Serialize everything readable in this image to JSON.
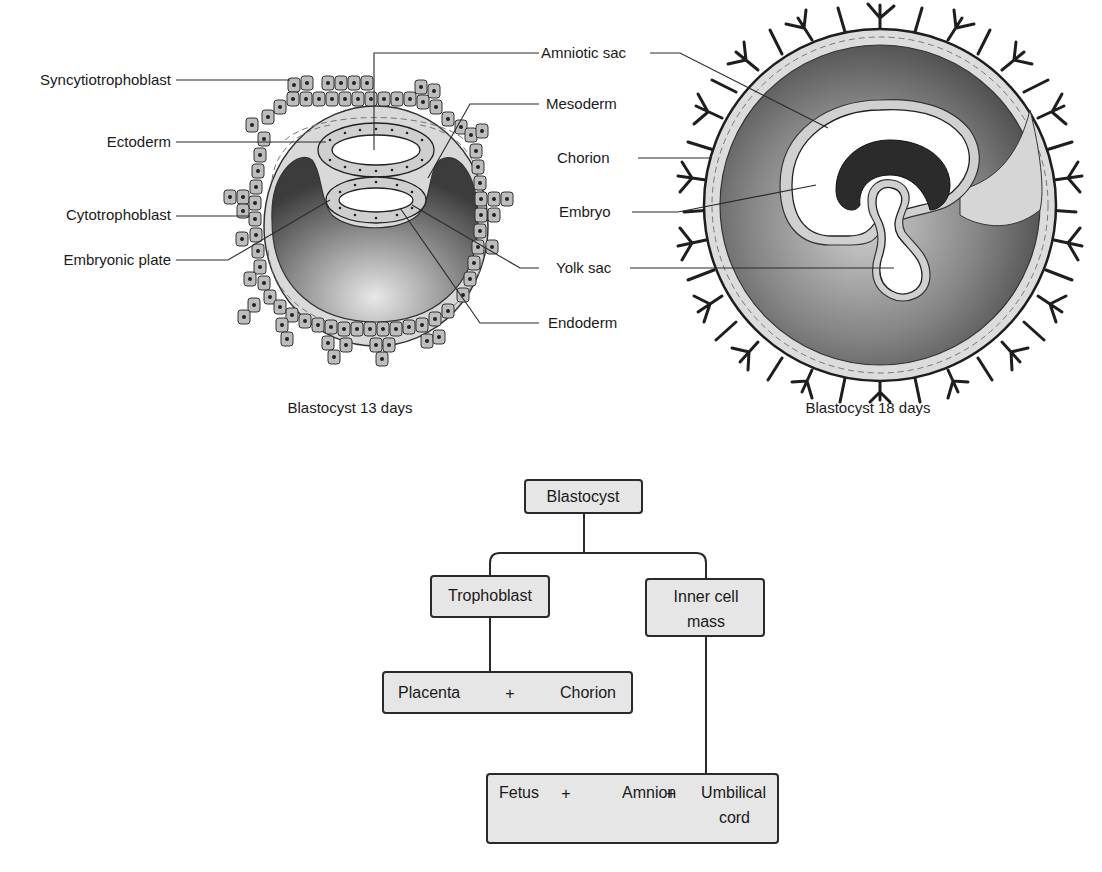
{
  "figure": {
    "left_diagram": {
      "caption": "Blastocyst 13 days",
      "labels": {
        "syncytiotrophoblast": "Syncytiotrophoblast",
        "ectoderm": "Ectoderm",
        "cytotrophoblast": "Cytotrophoblast",
        "embryonic_plate": "Embryonic plate"
      }
    },
    "shared_labels": {
      "amniotic_sac": "Amniotic sac",
      "mesoderm": "Mesoderm",
      "chorion": "Chorion",
      "embryo": "Embryo",
      "yolk_sac": "Yolk sac",
      "endoderm": "Endoderm"
    },
    "right_diagram": {
      "caption": "Blastocyst 18 days"
    },
    "flowchart": {
      "root": "Blastocyst",
      "trophoblast": "Trophoblast",
      "inner_cell_mass_line1": "Inner cell",
      "inner_cell_mass_line2": "mass",
      "trophoblast_outcome": {
        "item1": "Placenta",
        "plus": "+",
        "item2": "Chorion"
      },
      "icm_outcome": {
        "item1": "Fetus",
        "plus1": "+",
        "item2": "Amnion",
        "plus2": "+",
        "item3_line1": "Umbilical",
        "item3_line2": "cord"
      }
    },
    "colors": {
      "box_fill": "#e6e6e6",
      "outline": "#2a2a2a",
      "cavity_dark": "#4a4a4a",
      "cavity_light": "#dcdcdc",
      "embryo_dark": "#2b2b2b"
    }
  }
}
